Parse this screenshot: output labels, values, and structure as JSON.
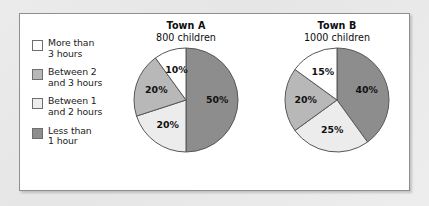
{
  "colors": {
    "more_than_3": "#ffffff",
    "between_2_and_3": "#b8b8b8",
    "between_1_and_2": "#ececec",
    "less_than_1": "#8d8d8d",
    "outline": "#575757",
    "panel_bg": "#ffffff",
    "page_bg": "#e9e9e9"
  },
  "legend": {
    "items": [
      {
        "label": "More than\n3 hours",
        "swatch": "#ffffff",
        "key": "more_than_3"
      },
      {
        "label": "Between 2\nand 3 hours",
        "swatch": "#b8b8b8",
        "key": "between_2_and_3"
      },
      {
        "label": "Between 1\nand 2 hours",
        "swatch": "#ececec",
        "key": "between_1_and_2"
      },
      {
        "label": "Less than\n1 hour",
        "swatch": "#8d8d8d",
        "key": "less_than_1"
      }
    ]
  },
  "charts": {
    "town_a": {
      "title": "Town A",
      "subtitle": "800 children",
      "labels": [
        "50%",
        "20%",
        "20%",
        "10%"
      ]
    },
    "town_b": {
      "title": "Town B",
      "subtitle": "1000 children",
      "labels": [
        "40%",
        "25%",
        "20%",
        "15%"
      ]
    }
  },
  "chart_data": [
    {
      "type": "pie",
      "title": "Town A",
      "subtitle": "800 children",
      "total_children": 800,
      "start_angle": 0,
      "direction": "clockwise",
      "categories": [
        "Less than 1 hour",
        "Between 1 and 2 hours",
        "Between 2 and 3 hours",
        "More than 3 hours"
      ],
      "values": [
        50,
        20,
        20,
        10
      ],
      "value_unit": "percent",
      "data_labels": [
        "50%",
        "20%",
        "20%",
        "10%"
      ],
      "counts": [
        400,
        160,
        160,
        80
      ],
      "colors": [
        "#8d8d8d",
        "#ececec",
        "#b8b8b8",
        "#ffffff"
      ],
      "legend_position": "left"
    },
    {
      "type": "pie",
      "title": "Town B",
      "subtitle": "1000 children",
      "total_children": 1000,
      "start_angle": 0,
      "direction": "clockwise",
      "categories": [
        "Less than 1 hour",
        "Between 1 and 2 hours",
        "Between 2 and 3 hours",
        "More than 3 hours"
      ],
      "values": [
        40,
        25,
        20,
        15
      ],
      "value_unit": "percent",
      "data_labels": [
        "40%",
        "25%",
        "20%",
        "15%"
      ],
      "counts": [
        400,
        250,
        200,
        150
      ],
      "colors": [
        "#8d8d8d",
        "#ececec",
        "#b8b8b8",
        "#ffffff"
      ],
      "legend_position": "left"
    }
  ]
}
